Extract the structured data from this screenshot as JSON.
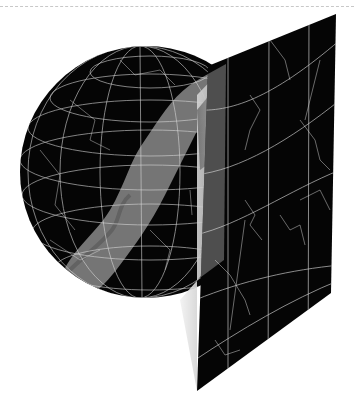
{
  "figure": {
    "title": "",
    "colors": {
      "background": "#ffffff",
      "sky": "#050505",
      "grid_lines": "#d8d8d8",
      "milky_way": "#8a8a8a",
      "fold_shadow": "#b5b5b5",
      "top_rule": "#c8c8c8"
    },
    "globe": {
      "center": [
        146,
        172
      ],
      "radius": 126,
      "meridians": 7,
      "parallels": 7
    },
    "panel": {
      "corners": [
        [
          208,
          66
        ],
        [
          336,
          14
        ],
        [
          331,
          293
        ],
        [
          197,
          391
        ]
      ],
      "vertical_lines_x": [
        228,
        269,
        309
      ],
      "curved_parallels": 5
    }
  }
}
